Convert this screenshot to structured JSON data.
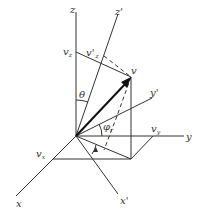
{
  "figure": {
    "type": "3d-coordinate-rotation-diagram",
    "labels": {
      "z": "z",
      "z_prime": "z'",
      "y": "y",
      "y_prime": "y'",
      "x": "x",
      "x_prime": "x'",
      "v": "v",
      "v_z": "v",
      "v_z_sub": "z",
      "v_prime_z": "v'",
      "v_prime_z_sub": "z",
      "v_y": "v",
      "v_y_sub": "y",
      "v_x": "v",
      "v_x_sub": "x",
      "theta": "θ",
      "phi": "φ",
      "phi_sub": "r"
    },
    "colors": {
      "line": "#333333",
      "vector": "#111111",
      "background": "#ffffff"
    }
  }
}
